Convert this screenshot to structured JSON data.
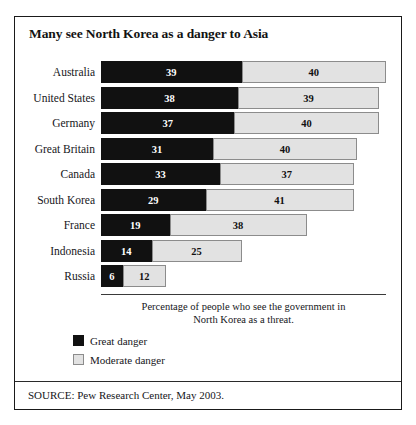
{
  "figure": {
    "title": "Many see North Korea as a danger to Asia",
    "axis_caption_line1": "Percentage of people who see the government in",
    "axis_caption_line2": "North Korea as a threat.",
    "source": "SOURCE: Pew Research Center, May 2003."
  },
  "legend": {
    "items": [
      {
        "label": "Great danger",
        "color": "#111111"
      },
      {
        "label": "Moderate danger",
        "color": "#e2e2e2"
      }
    ]
  },
  "chart_data": {
    "type": "bar",
    "orientation": "horizontal",
    "stacked": true,
    "title": "Many see North Korea as a danger to Asia",
    "xlabel": "Percentage of people who see the government in North Korea as a threat.",
    "ylabel": "",
    "xlim": [
      0,
      79
    ],
    "grid": false,
    "legend_position": "below-left",
    "categories": [
      "Australia",
      "United States",
      "Germany",
      "Great Britain",
      "Canada",
      "South Korea",
      "France",
      "Indonesia",
      "Russia"
    ],
    "series": [
      {
        "name": "Great danger",
        "color": "#111111",
        "values": [
          39,
          38,
          37,
          31,
          33,
          29,
          19,
          14,
          6
        ]
      },
      {
        "name": "Moderate danger",
        "color": "#e2e2e2",
        "values": [
          40,
          39,
          40,
          40,
          37,
          41,
          38,
          25,
          12
        ]
      }
    ],
    "totals": [
      79,
      77,
      77,
      71,
      70,
      70,
      57,
      39,
      18
    ],
    "source": "SOURCE: Pew Research Center, May 2003."
  }
}
